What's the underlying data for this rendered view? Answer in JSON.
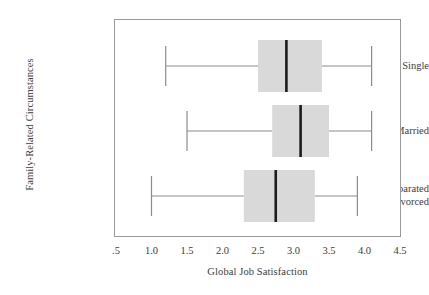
{
  "chart_data": {
    "type": "box",
    "title": "",
    "xlabel": "Global Job Satisfaction",
    "ylabel": "Family-Related Circumstances",
    "orientation": "horizontal",
    "xlim": [
      0.5,
      4.5
    ],
    "grid": false,
    "legend": "none",
    "xticks": [
      {
        "value": 0.5,
        "label": ".5"
      },
      {
        "value": 1.0,
        "label": "1.0"
      },
      {
        "value": 1.5,
        "label": "1.5"
      },
      {
        "value": 2.0,
        "label": "2.0"
      },
      {
        "value": 2.5,
        "label": "2.5"
      },
      {
        "value": 3.0,
        "label": "3.0"
      },
      {
        "value": 3.5,
        "label": "3.5"
      },
      {
        "value": 4.0,
        "label": "4.0"
      },
      {
        "value": 4.5,
        "label": "4.5"
      }
    ],
    "categories": [
      "Single",
      "Married",
      "Separated or Divorced"
    ],
    "boxes": [
      {
        "category": "Single",
        "label_lines": [
          "Single"
        ],
        "whisker_low": 1.2,
        "q1": 2.5,
        "median": 2.9,
        "q3": 3.4,
        "whisker_high": 4.1
      },
      {
        "category": "Married",
        "label_lines": [
          "Married"
        ],
        "whisker_low": 1.5,
        "q1": 2.7,
        "median": 3.1,
        "q3": 3.5,
        "whisker_high": 4.1
      },
      {
        "category": "Separated or Divorced",
        "label_lines": [
          "Separated",
          "or Divorced"
        ],
        "whisker_low": 1.0,
        "q1": 2.3,
        "median": 2.75,
        "q3": 3.3,
        "whisker_high": 3.9
      }
    ],
    "colors": {
      "box_fill": "#d9d9d9",
      "median_line": "#1c1c1c",
      "whisker_line": "#8c8c8c",
      "frame": "#9a9a9a",
      "text": "#3d3d3d",
      "background": "#ffffff"
    }
  },
  "axis": {
    "y_title": "Family-Related Circumstances",
    "x_title": "Global Job Satisfaction"
  },
  "category_labels": {
    "single": "Single",
    "married": "Married",
    "separated_line1": "Separated",
    "separated_line2": "or Divorced"
  }
}
